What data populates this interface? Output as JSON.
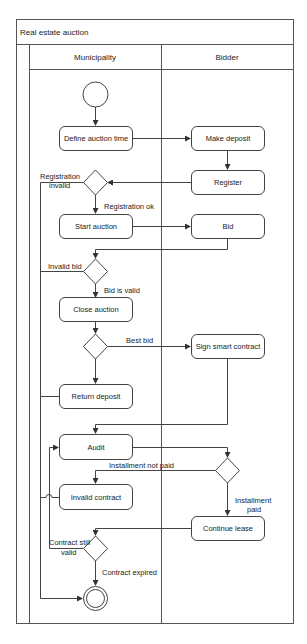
{
  "diagram": {
    "title": "Real estate auction",
    "lanes": [
      {
        "name": "Municipality"
      },
      {
        "name": "Bidder"
      }
    ],
    "nodes": {
      "define_auction_time": "Define auction time",
      "make_deposit": "Make deposit",
      "register": "Register",
      "start_auction": "Start auction",
      "bid": "Bid",
      "close_auction": "Close auction",
      "sign_smart_contract": "Sign smart contract",
      "return_deposit": "Return deposit",
      "audit": "Audit",
      "invalid_contract": "Invalid contract",
      "continue_lease": "Continue lease"
    },
    "edge_labels": {
      "registration_invalid_1": "Registration",
      "registration_invalid_2": "invalid",
      "registration_ok": "Registration ok",
      "invalid_bid": "Invalid bid",
      "bid_is_valid": "Bid is valid",
      "best_bid": "Best bid",
      "installment_not_paid": "Installment  not paid",
      "installment_paid_1": "Installment",
      "installment_paid_2": "paid",
      "contract_still_valid_1": "Contract still",
      "contract_still_valid_2": "valid",
      "contract_expired": "Contract expired"
    },
    "colors": {
      "stroke": "#444444",
      "text": "#222222",
      "background": "#ffffff"
    }
  }
}
